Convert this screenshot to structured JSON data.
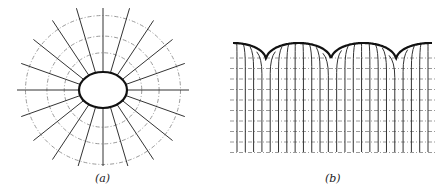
{
  "figure": {
    "panels": [
      {
        "id": "a",
        "caption": "(a)",
        "description": "Elliptical boundary with radial field lines and dash-dot equipotential contours",
        "center": [
          103,
          90
        ],
        "ellipse_rx": 24,
        "ellipse_ry": 18,
        "radial_line_count": 20,
        "radial_length": 86,
        "contour_radii": [
          38,
          55,
          76
        ]
      },
      {
        "id": "b",
        "caption": "(b)",
        "description": "Periodic scalloped boundary (three arches) with vertical field lines curving into arches and horizontal dash-dot equipotential lines",
        "x_range": [
          233,
          432
        ],
        "top_y": 43,
        "bottom_y": 152,
        "cusps_x": [
          266,
          331,
          396
        ],
        "arch_count": 3,
        "horizontal_line_count": 10
      }
    ],
    "colors": {
      "boundary": "#111111",
      "field_line": "#333333",
      "equipotential": "#9a9a9a"
    }
  }
}
